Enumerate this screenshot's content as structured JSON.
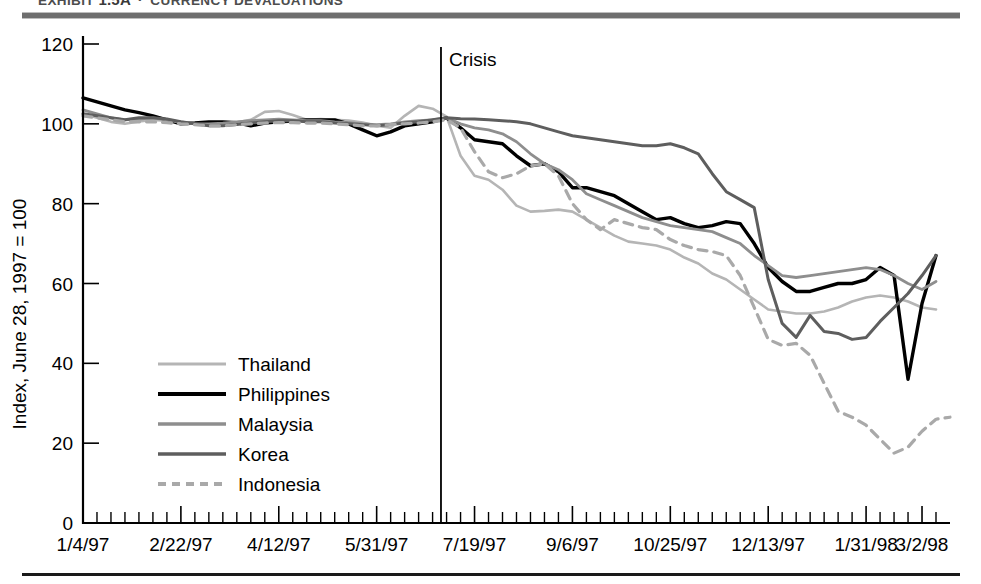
{
  "exhibit": {
    "label": "EXHIBIT",
    "number": "1.5A",
    "separator": "·",
    "title": "CURRENCY DEVALUATIONS"
  },
  "annotations": {
    "crisis_label": "Crisis",
    "crisis_x": "7/2/97"
  },
  "colors": {
    "thailand": "#b5b5b5",
    "philippines": "#000000",
    "malaysia": "#8e8e8e",
    "korea": "#5e5e5e",
    "indonesia": "#a9a9a9",
    "axis": "#000000",
    "rule_top": "#6e6e6e",
    "rule_bottom": "#1a1a1a"
  },
  "chart_data": {
    "type": "line",
    "title": "EXHIBIT 1.5A · CURRENCY DEVALUATIONS",
    "xlabel": "",
    "ylabel": "Index, June 28, 1997 = 100",
    "ylim": [
      0,
      120
    ],
    "yticks": [
      0,
      20,
      40,
      60,
      80,
      100,
      120
    ],
    "ytick_labels": [
      "0",
      "20",
      "40",
      "60",
      "80",
      "100",
      "120"
    ],
    "xtick_labels": [
      "1/4/97",
      "2/22/97",
      "4/12/97",
      "5/31/97",
      "7/19/97",
      "9/6/97",
      "10/25/97",
      "12/13/97",
      "1/31/98",
      "3/2/98"
    ],
    "xtick_index": [
      0,
      7,
      14,
      21,
      28,
      35,
      42,
      49,
      56,
      60
    ],
    "x_count": 62,
    "grid": false,
    "legend_position": "inside-left",
    "annotations": [
      {
        "text": "Crisis",
        "x_index": 25.6,
        "note": "vertical line marking onset of Asian financial crisis"
      }
    ],
    "series": [
      {
        "name": "Thailand",
        "color": "#b5b5b5",
        "style": "solid",
        "width": 2.6,
        "values": [
          102.5,
          101.5,
          100.5,
          100.0,
          100.6,
          101.0,
          100.8,
          100.5,
          100.0,
          99.5,
          99.8,
          100.4,
          101.0,
          103.0,
          103.2,
          102.2,
          101.0,
          101.2,
          101.0,
          100.8,
          100.3,
          99.5,
          99.0,
          102.0,
          104.5,
          103.8,
          101.8,
          92.0,
          87.0,
          86.0,
          83.5,
          79.5,
          78.0,
          78.2,
          78.5,
          78.0,
          76.0,
          74.0,
          72.0,
          70.5,
          70.0,
          69.5,
          68.5,
          66.5,
          65.0,
          62.5,
          61.0,
          58.5,
          56.0,
          53.5,
          53.0,
          52.5,
          52.5,
          53.0,
          54.0,
          55.5,
          56.5,
          57.0,
          56.5,
          55.5,
          54.0,
          53.5
        ]
      },
      {
        "name": "Philippines",
        "color": "#000000",
        "style": "solid",
        "width": 3.4,
        "values": [
          106.5,
          105.5,
          104.5,
          103.5,
          102.8,
          102.0,
          101.0,
          100.0,
          100.2,
          100.5,
          100.5,
          100.3,
          99.5,
          100.2,
          100.5,
          100.7,
          101.0,
          101.0,
          101.0,
          100.0,
          98.5,
          97.0,
          98.0,
          99.5,
          100.0,
          100.5,
          101.5,
          99.0,
          96.0,
          95.5,
          95.0,
          92.0,
          89.5,
          90.0,
          88.0,
          84.0,
          84.0,
          83.0,
          82.0,
          80.0,
          78.0,
          76.0,
          76.5,
          75.0,
          74.0,
          74.5,
          75.5,
          75.0,
          70.0,
          64.0,
          60.5,
          58.0,
          58.0,
          59.0,
          60.0,
          60.0,
          61.0,
          64.0,
          62.0,
          36.0,
          55.0,
          67.0
        ]
      },
      {
        "name": "Malaysia",
        "color": "#8e8e8e",
        "style": "solid",
        "width": 2.8,
        "values": [
          103.5,
          102.5,
          101.5,
          101.0,
          101.2,
          101.5,
          101.0,
          100.3,
          100.0,
          100.0,
          100.2,
          100.5,
          100.8,
          101.0,
          101.2,
          101.0,
          100.8,
          100.8,
          100.5,
          100.3,
          100.0,
          99.8,
          100.0,
          100.5,
          100.8,
          101.0,
          101.5,
          100.0,
          99.0,
          98.5,
          97.5,
          95.5,
          92.5,
          90.0,
          88.5,
          86.0,
          82.5,
          81.0,
          79.5,
          78.0,
          76.5,
          75.5,
          74.5,
          74.0,
          73.5,
          73.0,
          71.5,
          70.0,
          67.0,
          64.5,
          62.0,
          61.5,
          62.0,
          62.5,
          63.0,
          63.5,
          64.0,
          63.5,
          62.0,
          60.0,
          58.5,
          60.5
        ]
      },
      {
        "name": "Korea",
        "color": "#5e5e5e",
        "style": "solid",
        "width": 3.0,
        "values": [
          102.5,
          102.0,
          101.5,
          101.0,
          101.5,
          101.5,
          101.2,
          100.5,
          100.0,
          99.5,
          99.5,
          99.8,
          100.2,
          100.5,
          100.8,
          100.8,
          100.5,
          100.5,
          100.2,
          100.0,
          99.8,
          99.5,
          99.8,
          100.2,
          100.5,
          101.0,
          101.5,
          101.3,
          101.2,
          101.0,
          100.8,
          100.5,
          100.0,
          99.0,
          98.0,
          97.0,
          96.5,
          96.0,
          95.5,
          95.0,
          94.5,
          94.5,
          95.0,
          94.0,
          92.5,
          87.5,
          83.0,
          81.0,
          79.0,
          61.0,
          50.0,
          46.5,
          52.0,
          48.0,
          47.5,
          46.0,
          46.5,
          50.5,
          54.0,
          57.5,
          62.0,
          67.0
        ]
      },
      {
        "name": "Indonesia",
        "color": "#a9a9a9",
        "style": "dashed",
        "width": 3.2,
        "values": [
          102.0,
          101.5,
          101.0,
          100.5,
          100.5,
          100.5,
          100.3,
          100.0,
          99.8,
          99.5,
          99.5,
          99.8,
          100.0,
          100.2,
          100.3,
          100.3,
          100.2,
          100.2,
          100.0,
          99.8,
          99.5,
          99.5,
          99.8,
          100.0,
          100.2,
          100.5,
          101.0,
          99.0,
          93.0,
          88.0,
          86.5,
          87.5,
          89.5,
          90.0,
          87.0,
          80.0,
          76.0,
          73.5,
          76.0,
          75.0,
          74.0,
          73.5,
          71.0,
          69.5,
          68.5,
          68.0,
          67.0,
          62.0,
          54.0,
          46.0,
          44.5,
          45.0,
          42.0,
          35.0,
          28.0,
          26.5,
          24.5,
          21.0,
          17.5,
          19.0,
          23.0,
          26.0,
          26.5
        ]
      }
    ]
  },
  "legend": {
    "items": [
      {
        "label": "Thailand"
      },
      {
        "label": "Philippines"
      },
      {
        "label": "Malaysia"
      },
      {
        "label": "Korea"
      },
      {
        "label": "Indonesia"
      }
    ]
  }
}
